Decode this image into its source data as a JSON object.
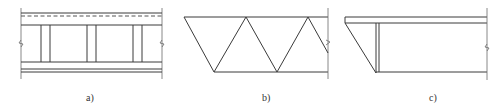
{
  "figure": {
    "panels": [
      {
        "id": "a",
        "label": "a)",
        "description": "girder segment with top dashed line, three pairs of vertical stiffeners, double bottom flange, break marks at both ends"
      },
      {
        "id": "b",
        "label": "b)",
        "description": "Warren truss segment with inclined end, break mark at right"
      },
      {
        "id": "c",
        "label": "c)",
        "description": "cantilever girder end with inclined bottom and vertical stiffener, break mark at right"
      }
    ],
    "colors": {
      "line": "#3a3a3a",
      "background": "#ffffff"
    }
  }
}
